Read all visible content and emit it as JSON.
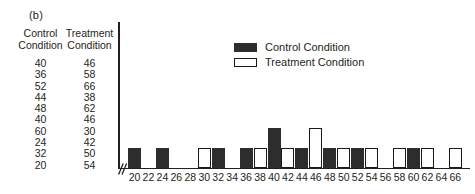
{
  "panel": {
    "label": "(b)"
  },
  "table": {
    "headers": [
      "Control\nCondition",
      "Treatment\nCondition"
    ],
    "header_control_line1": "Control",
    "header_control_line2": "Condition",
    "header_treatment_line1": "Treatment",
    "header_treatment_line2": "Condition",
    "rows": [
      {
        "control": "40",
        "treatment": "46"
      },
      {
        "control": "36",
        "treatment": "58"
      },
      {
        "control": "52",
        "treatment": "66"
      },
      {
        "control": "44",
        "treatment": "38"
      },
      {
        "control": "48",
        "treatment": "62"
      },
      {
        "control": "40",
        "treatment": "46"
      },
      {
        "control": "60",
        "treatment": "30"
      },
      {
        "control": "24",
        "treatment": "42"
      },
      {
        "control": "32",
        "treatment": "50"
      },
      {
        "control": "20",
        "treatment": "54"
      }
    ]
  },
  "legend": {
    "position": "top-center",
    "entries": [
      {
        "label": "Control Condition",
        "color": "#2d2d2d",
        "swatch": "filled"
      },
      {
        "label": "Treatment Condition",
        "color": "#ffffff",
        "swatch": "outlined"
      }
    ]
  },
  "colors": {
    "control": "#2d2d2d",
    "treatment": "#ffffff",
    "outline": "#1a1a1a",
    "axis": "#231f20",
    "text": "#231f20"
  },
  "chart_data": {
    "type": "bar",
    "title": "",
    "xlabel": "",
    "ylabel": "",
    "grid": false,
    "axis_break": true,
    "ylim": [
      0,
      3
    ],
    "bar_unit_height_px": 20,
    "categories": [
      20,
      22,
      24,
      26,
      28,
      30,
      32,
      34,
      36,
      38,
      40,
      42,
      44,
      46,
      48,
      50,
      52,
      54,
      56,
      58,
      60,
      62,
      64,
      66
    ],
    "tick_labels": [
      "20",
      "22",
      "24",
      "26",
      "28",
      "30",
      "32",
      "34",
      "36",
      "38",
      "40",
      "42",
      "44",
      "46",
      "48",
      "50",
      "52",
      "54",
      "56",
      "58",
      "60",
      "62",
      "64",
      "66"
    ],
    "series": [
      {
        "name": "Control Condition",
        "color": "#2d2d2d",
        "values": [
          1,
          0,
          1,
          0,
          0,
          0,
          1,
          0,
          1,
          0,
          2,
          0,
          1,
          0,
          1,
          0,
          1,
          0,
          0,
          0,
          1,
          0,
          0,
          0
        ]
      },
      {
        "name": "Treatment Condition",
        "color": "#ffffff",
        "values": [
          0,
          0,
          0,
          0,
          0,
          1,
          0,
          0,
          0,
          1,
          0,
          1,
          0,
          2,
          0,
          1,
          0,
          1,
          0,
          1,
          0,
          1,
          0,
          1
        ]
      }
    ]
  }
}
